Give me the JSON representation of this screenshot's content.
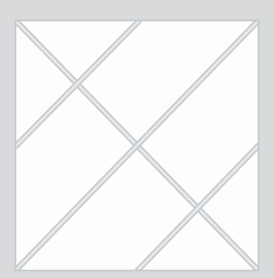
{
  "figure": {
    "canvas": {
      "width": 274,
      "height": 278
    },
    "colors": {
      "background": "#d8dadb",
      "panel_fill": "#fdfdfd",
      "panel_border": "#c6c9cb",
      "line": "#d2d5d7",
      "line_highlight": "#eceef0",
      "line_shadow": "#c2c6c9"
    },
    "panel": {
      "x": 15,
      "y": 20,
      "width": 244,
      "height": 251
    },
    "line_width": 5,
    "segments": [
      {
        "name": "main-diagonal-tl-br",
        "x1": 15,
        "y1": 20,
        "x2": 259,
        "y2": 271
      },
      {
        "name": "anti-diagonal-tr-bl",
        "x1": 259,
        "y1": 20,
        "x2": 15,
        "y2": 271
      },
      {
        "name": "brace-top-to-left",
        "x1": 140,
        "y1": 20,
        "x2": 15,
        "y2": 147
      },
      {
        "name": "brace-right-to-bottom",
        "x1": 259,
        "y1": 145,
        "x2": 137,
        "y2": 271
      }
    ],
    "intersections": [
      {
        "name": "upper-left-crossing",
        "x": 79,
        "y": 84
      },
      {
        "name": "center-crossing",
        "x": 137,
        "y": 141
      },
      {
        "name": "lower-right-crossing",
        "x": 204,
        "y": 209
      }
    ]
  }
}
